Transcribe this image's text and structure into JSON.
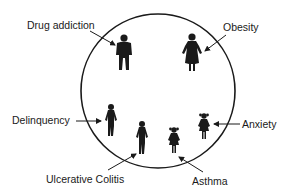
{
  "diagram": {
    "type": "family-circle",
    "circle": {
      "cx": 158,
      "cy": 91,
      "r": 77,
      "stroke": "#1a1a1a"
    },
    "labels": [
      {
        "id": "drug-addiction",
        "text": "Drug addiction",
        "x": 27,
        "y": 19
      },
      {
        "id": "obesity",
        "text": "Obesity",
        "x": 223,
        "y": 21
      },
      {
        "id": "delinquency",
        "text": "Delinquency",
        "x": 12,
        "y": 114
      },
      {
        "id": "anxiety",
        "text": "Anxiety",
        "x": 242,
        "y": 118
      },
      {
        "id": "ulcerative-colitis",
        "text": "Ulcerative Colitis",
        "x": 46,
        "y": 173
      },
      {
        "id": "asthma",
        "text": "Asthma",
        "x": 192,
        "y": 175
      }
    ],
    "figures": [
      {
        "id": "father",
        "role": "adult-male",
        "label": "Drug addiction"
      },
      {
        "id": "mother",
        "role": "adult-female",
        "label": "Obesity"
      },
      {
        "id": "child-1",
        "role": "teen",
        "label": "Delinquency"
      },
      {
        "id": "child-2",
        "role": "teen",
        "label": "Ulcerative Colitis"
      },
      {
        "id": "child-3",
        "role": "young-girl",
        "label": "Asthma"
      },
      {
        "id": "child-4",
        "role": "young-girl",
        "label": "Anxiety"
      }
    ]
  }
}
